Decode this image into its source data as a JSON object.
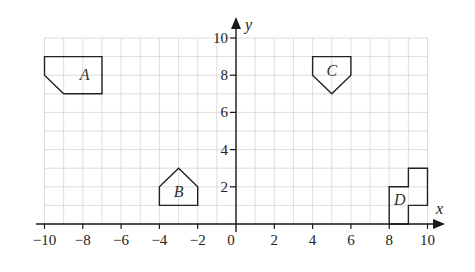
{
  "diagram": {
    "type": "coordinate-grid",
    "x_axis": {
      "label": "x",
      "min": -10,
      "max": 10,
      "tick_step": 2,
      "ticks": [
        -10,
        -8,
        -6,
        -4,
        -2,
        0,
        2,
        4,
        6,
        8,
        10
      ],
      "tick_labels": [
        "−10",
        "−8",
        "−6",
        "−4",
        "−2",
        "0",
        "2",
        "4",
        "6",
        "8",
        "10"
      ]
    },
    "y_axis": {
      "label": "y",
      "min": 0,
      "max": 10,
      "tick_step": 2,
      "ticks": [
        2,
        4,
        6,
        8,
        10
      ],
      "tick_labels": [
        "2",
        "4",
        "6",
        "8",
        "10"
      ]
    },
    "grid": {
      "x_min": -10,
      "x_max": 10,
      "y_min": 0,
      "y_max": 10,
      "step": 1
    },
    "shapes": [
      {
        "label": "A",
        "vertices": [
          [
            -10,
            9
          ],
          [
            -7,
            9
          ],
          [
            -7,
            7
          ],
          [
            -9,
            7
          ],
          [
            -10,
            8
          ]
        ],
        "label_pos": [
          -7.9,
          8
        ]
      },
      {
        "label": "B",
        "vertices": [
          [
            -4,
            1
          ],
          [
            -2,
            1
          ],
          [
            -2,
            2
          ],
          [
            -3,
            3
          ],
          [
            -4,
            2
          ]
        ],
        "label_pos": [
          -3,
          1.7
        ]
      },
      {
        "label": "C",
        "vertices": [
          [
            4,
            9
          ],
          [
            6,
            9
          ],
          [
            6,
            8
          ],
          [
            5,
            7
          ],
          [
            4,
            8
          ]
        ],
        "label_pos": [
          5,
          8.2
        ]
      },
      {
        "label": "D",
        "vertices": [
          [
            8,
            0
          ],
          [
            9,
            0
          ],
          [
            9,
            1
          ],
          [
            10,
            1
          ],
          [
            10,
            3
          ],
          [
            9,
            3
          ],
          [
            9,
            2
          ],
          [
            8,
            2
          ]
        ],
        "label_pos": [
          8.55,
          1.3
        ]
      }
    ]
  }
}
